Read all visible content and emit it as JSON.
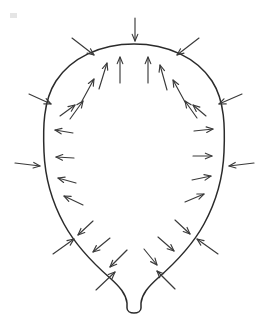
{
  "figure": {
    "title": "Balloon with inward and outward pressure arrows",
    "width": 268,
    "height": 324,
    "background_color": "#ffffff",
    "outline_color": "#2b2b2b",
    "arrow_color": "#3a3a3a",
    "outline_stroke_width": 1.5,
    "arrow_stroke_width": 1.15
  },
  "shape": {
    "name": "balloon-outline",
    "kind": "teardrop",
    "body_top_y": 44,
    "body_left_x": 44,
    "body_right_x": 225,
    "body_center_x": 134,
    "neck_bottom_y": 312,
    "neck_half_width": 7,
    "path": "M 134 44 C 100 44 71 58 56 81 C 43 101 43 128 44 152 C 45 178 52 202 64 224 C 76 246 94 264 110 278 C 120 287 126 294 127 303 L 127 308 C 127 311 130 313 134 313 C 138 313 141 311 141 308 L 141 303 C 142 294 148 287 158 278 C 174 264 192 246 204 224 C 216 202 223 178 224 152 C 225 128 225 101 212 81 C 197 58 168 44 134 44 Z"
  },
  "arrows": {
    "inside_label": "outward-pressure-arrow",
    "outside_label": "inward-pressure-arrow",
    "inside_count": 22,
    "outside_count": 16,
    "inside_direction": "outward normal to surface",
    "outside_direction": "inward toward surface",
    "inside": [
      {
        "id": "in-top-left-of-center",
        "x1": 120,
        "y1": 83,
        "x2": 120,
        "y2": 57
      },
      {
        "id": "in-top-right-of-center",
        "x1": 148,
        "y1": 83,
        "x2": 148,
        "y2": 57
      },
      {
        "id": "in-upper-left-1",
        "x1": 99,
        "y1": 89,
        "x2": 107,
        "y2": 63
      },
      {
        "id": "in-upper-left-2",
        "x1": 82,
        "y1": 101,
        "x2": 94,
        "y2": 79
      },
      {
        "id": "in-upper-left-3",
        "x1": 70,
        "y1": 119,
        "x2": 83,
        "y2": 101
      },
      {
        "id": "in-upper-left-4",
        "x1": 60,
        "y1": 116,
        "x2": 75,
        "y2": 105
      },
      {
        "id": "in-upper-right-1",
        "x1": 167,
        "y1": 90,
        "x2": 160,
        "y2": 65
      },
      {
        "id": "in-upper-right-2",
        "x1": 185,
        "y1": 102,
        "x2": 173,
        "y2": 80
      },
      {
        "id": "in-upper-right-3",
        "x1": 197,
        "y1": 118,
        "x2": 185,
        "y2": 101
      },
      {
        "id": "in-upper-right-4",
        "x1": 206,
        "y1": 116,
        "x2": 193,
        "y2": 105
      },
      {
        "id": "in-left-1",
        "x1": 73,
        "y1": 133,
        "x2": 55,
        "y2": 130
      },
      {
        "id": "in-left-2",
        "x1": 74,
        "y1": 158,
        "x2": 56,
        "y2": 157
      },
      {
        "id": "in-left-3",
        "x1": 76,
        "y1": 183,
        "x2": 58,
        "y2": 178
      },
      {
        "id": "in-left-4",
        "x1": 83,
        "y1": 205,
        "x2": 64,
        "y2": 196
      },
      {
        "id": "in-right-1",
        "x1": 194,
        "y1": 131,
        "x2": 213,
        "y2": 129
      },
      {
        "id": "in-right-2",
        "x1": 193,
        "y1": 156,
        "x2": 212,
        "y2": 156
      },
      {
        "id": "in-right-3",
        "x1": 192,
        "y1": 180,
        "x2": 211,
        "y2": 176
      },
      {
        "id": "in-right-4",
        "x1": 185,
        "y1": 202,
        "x2": 204,
        "y2": 194
      },
      {
        "id": "in-lower-left-1",
        "x1": 93,
        "y1": 221,
        "x2": 78,
        "y2": 235
      },
      {
        "id": "in-lower-left-2",
        "x1": 110,
        "y1": 238,
        "x2": 93,
        "y2": 252
      },
      {
        "id": "in-lower-left-3",
        "x1": 127,
        "y1": 250,
        "x2": 110,
        "y2": 267
      },
      {
        "id": "in-lower-right-1",
        "x1": 175,
        "y1": 220,
        "x2": 190,
        "y2": 234
      },
      {
        "id": "in-lower-right-2",
        "x1": 158,
        "y1": 237,
        "x2": 174,
        "y2": 251
      },
      {
        "id": "in-lower-right-3",
        "x1": 144,
        "y1": 249,
        "x2": 157,
        "y2": 265
      }
    ],
    "outside": [
      {
        "id": "out-top",
        "x1": 135,
        "y1": 18,
        "x2": 135,
        "y2": 41
      },
      {
        "id": "out-top-left",
        "x1": 72,
        "y1": 38,
        "x2": 94,
        "y2": 55
      },
      {
        "id": "out-top-right",
        "x1": 199,
        "y1": 38,
        "x2": 177,
        "y2": 55
      },
      {
        "id": "out-upper-left",
        "x1": 29,
        "y1": 94,
        "x2": 51,
        "y2": 104
      },
      {
        "id": "out-upper-right",
        "x1": 242,
        "y1": 94,
        "x2": 219,
        "y2": 104
      },
      {
        "id": "out-left",
        "x1": 15,
        "y1": 163,
        "x2": 40,
        "y2": 166
      },
      {
        "id": "out-right",
        "x1": 254,
        "y1": 163,
        "x2": 229,
        "y2": 166
      },
      {
        "id": "out-lower-left",
        "x1": 53,
        "y1": 254,
        "x2": 74,
        "y2": 239
      },
      {
        "id": "out-lower-right",
        "x1": 218,
        "y1": 254,
        "x2": 197,
        "y2": 239
      },
      {
        "id": "out-bottom-left",
        "x1": 96,
        "y1": 290,
        "x2": 115,
        "y2": 272
      },
      {
        "id": "out-bottom-right",
        "x1": 175,
        "y1": 289,
        "x2": 157,
        "y2": 271
      }
    ]
  }
}
